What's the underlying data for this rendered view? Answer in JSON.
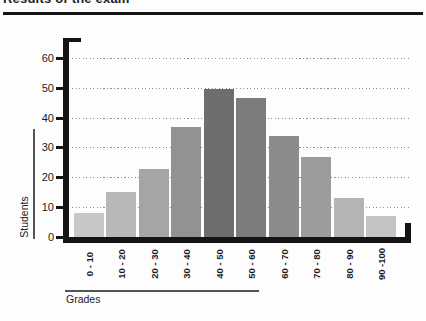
{
  "title": {
    "text": "Results of the exam"
  },
  "chart_data": {
    "type": "bar",
    "title": "Results of the exam",
    "xlabel": "Grades",
    "ylabel": "Students",
    "categories": [
      "0 - 10",
      "10 - 20",
      "20 - 30",
      "30 - 40",
      "40 - 50",
      "50 - 60",
      "60 - 70",
      "70 - 80",
      "80 - 90",
      "90 -100"
    ],
    "values": [
      8,
      15,
      23,
      37,
      50,
      47,
      34,
      27,
      13,
      7
    ],
    "bar_colors": [
      "#c8c8c8",
      "#b8b8b8",
      "#a5a5a5",
      "#929292",
      "#6e6e6e",
      "#7c7c7c",
      "#8c8c8c",
      "#9c9c9c",
      "#b4b4b4",
      "#c4c4c4"
    ],
    "yticks": [
      0,
      10,
      20,
      30,
      40,
      50,
      60
    ],
    "ylim": [
      0,
      65
    ],
    "grid": "dotted-horizontal",
    "legend": "none",
    "axis_color": "#141414"
  }
}
